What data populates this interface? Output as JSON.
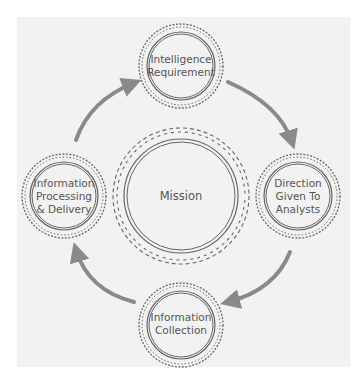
{
  "diagram": {
    "type": "cycle",
    "center": {
      "label": "Mission"
    },
    "nodes": [
      {
        "id": "top",
        "lines": [
          "Intelligence",
          "Requirement"
        ]
      },
      {
        "id": "right",
        "lines": [
          "Direction",
          "Given To",
          "Analysts"
        ]
      },
      {
        "id": "bottom",
        "lines": [
          "Information",
          "Collection"
        ]
      },
      {
        "id": "left",
        "lines": [
          "Information",
          "Processing",
          "& Delivery"
        ]
      }
    ],
    "flow_direction": "clockwise",
    "colors": {
      "background_panel": "#f2f2f2",
      "arrow": "#8a8a8a",
      "ring": "#666666",
      "text": "#555555"
    }
  }
}
